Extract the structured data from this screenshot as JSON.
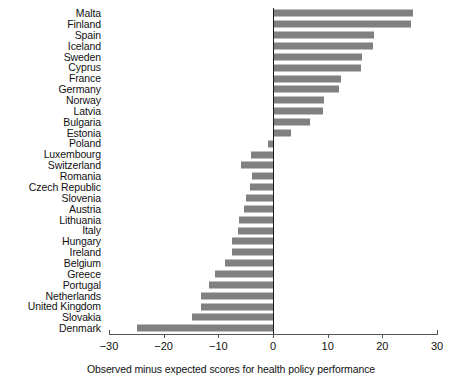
{
  "chart_data": {
    "type": "bar",
    "orientation": "horizontal",
    "title": "",
    "subtitle": "",
    "xlabel": "Observed minus expected scores for health policy performance",
    "ylabel": "",
    "xlim": [
      -30,
      30
    ],
    "xticks": [
      -30,
      -20,
      -10,
      0,
      10,
      20,
      30
    ],
    "xtick_labels": [
      "−30",
      "−20",
      "−10",
      "0",
      "10",
      "20",
      "30"
    ],
    "grid": false,
    "legend": "none",
    "bar_color": "#808080",
    "zero_line_color": "#1a1a1a",
    "categories": [
      "Malta",
      "Finland",
      "Spain",
      "Iceland",
      "Sweden",
      "Cyprus",
      "France",
      "Germany",
      "Norway",
      "Latvia",
      "Bulgaria",
      "Estonia",
      "Poland",
      "Luxembourg",
      "Switzerland",
      "Romania",
      "Czech Republic",
      "Slovenia",
      "Austria",
      "Lithuania",
      "Italy",
      "Hungary",
      "Ireland",
      "Belgium",
      "Greece",
      "Portugal",
      "Netherlands",
      "United Kingdom",
      "Slovakia",
      "Denmark"
    ],
    "values": [
      25.6,
      25.2,
      18.5,
      18.3,
      16.3,
      16.1,
      12.4,
      12.1,
      9.3,
      9.1,
      6.8,
      3.3,
      -1.0,
      -4.0,
      -5.9,
      -3.8,
      -4.2,
      -4.9,
      -5.3,
      -6.2,
      -6.4,
      -7.5,
      -7.5,
      -8.8,
      -10.6,
      -11.7,
      -13.2,
      -13.2,
      -14.8,
      -24.9
    ]
  }
}
